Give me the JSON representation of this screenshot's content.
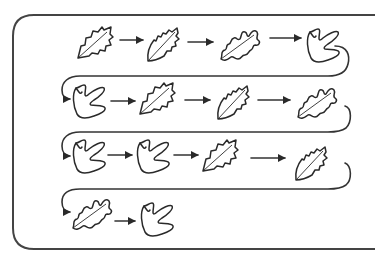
{
  "colors": {
    "stroke": "#2a2a2a",
    "frame": "#444444",
    "background": "#ffffff"
  },
  "leaf_types": {
    "holly": "holly-leaf-icon",
    "serrated": "serrated-leaf-icon",
    "oak": "oak-leaf-icon",
    "lobed": "three-lobed-leaf-icon"
  },
  "rows": [
    {
      "leaves": [
        "holly",
        "serrated",
        "oak",
        "lobed"
      ]
    },
    {
      "leaves": [
        "lobed",
        "holly",
        "serrated",
        "oak"
      ]
    },
    {
      "leaves": [
        "lobed",
        "lobed",
        "holly",
        "serrated"
      ]
    },
    {
      "leaves": [
        "oak",
        "lobed"
      ]
    }
  ]
}
